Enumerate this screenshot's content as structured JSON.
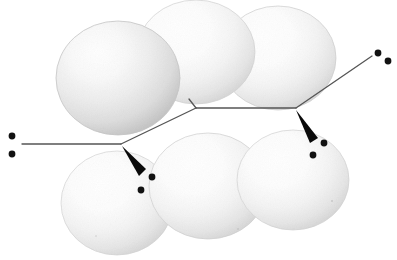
{
  "figure": {
    "background_color": "#ffffff",
    "width": 397,
    "height": 260
  },
  "palette": {
    "background": "#ffffff",
    "sphere_core": "#ffffff",
    "sphere_mid": "#f2f2f2",
    "sphere_edge": "#cfcfcf",
    "sphere_rim": "#bdbdbd",
    "bond_line": "#555555",
    "wedge_fill": "#0a0a0a",
    "dot_fill": "#121212"
  },
  "spheres": [
    {
      "id": "sphere-top-left",
      "label": "top-left sphere",
      "cx": 118,
      "cy": 78,
      "rx": 62,
      "ry": 57,
      "tone": "medium",
      "rim": "#c6c6c6"
    },
    {
      "id": "sphere-top-center",
      "label": "top-centre sphere",
      "cx": 196,
      "cy": 52,
      "rx": 59,
      "ry": 52,
      "tone": "light",
      "rim": "#d2d2d2"
    },
    {
      "id": "sphere-top-right",
      "label": "top-right sphere",
      "cx": 278,
      "cy": 58,
      "rx": 58,
      "ry": 52,
      "tone": "light",
      "rim": "#cfcfcf"
    },
    {
      "id": "sphere-bottom-left",
      "label": "bottom-left sphere",
      "cx": 117,
      "cy": 203,
      "rx": 56,
      "ry": 52,
      "tone": "light",
      "rim": "#d4d4d4"
    },
    {
      "id": "sphere-bottom-center",
      "label": "bottom-centre sphere",
      "cx": 208,
      "cy": 186,
      "rx": 59,
      "ry": 53,
      "tone": "light",
      "rim": "#d0d0d0"
    },
    {
      "id": "sphere-bottom-right",
      "label": "bottom-right sphere",
      "cx": 293,
      "cy": 180,
      "rx": 56,
      "ry": 50,
      "tone": "light",
      "rim": "#d2d2d2"
    }
  ],
  "bonds": {
    "stroke_color": "#555555",
    "stroke_width": 1.3,
    "segments": [
      {
        "id": "bond-left-terminal",
        "label": "left terminal bond",
        "x1": 22,
        "y1": 144,
        "x2": 121,
        "y2": 144
      },
      {
        "id": "bond-up-to-vertex",
        "label": "rising bond to first vertex",
        "x1": 121,
        "y1": 144,
        "x2": 196,
        "y2": 108
      },
      {
        "id": "bond-horizontal",
        "label": "central horizontal bond",
        "x1": 196,
        "y1": 108,
        "x2": 296,
        "y2": 108
      },
      {
        "id": "bond-right-rising",
        "label": "right rising bond",
        "x1": 296,
        "y1": 108,
        "x2": 372,
        "y2": 56
      },
      {
        "id": "bond-stub",
        "label": "short stub at first vertex",
        "x1": 196,
        "y1": 108,
        "x2": 189,
        "y2": 99
      }
    ]
  },
  "wedges": [
    {
      "id": "wedge-left",
      "label": "left solid wedge bond pointing down-right",
      "apex_x": 122,
      "apex_y": 146,
      "base_x1": 139,
      "base_y1": 176,
      "base_x2": 146,
      "base_y2": 169
    },
    {
      "id": "wedge-right",
      "label": "right solid wedge bond pointing down-left",
      "apex_x": 296,
      "apex_y": 110,
      "base_x1": 310,
      "base_y1": 143,
      "base_x2": 318,
      "base_y2": 138
    }
  ],
  "lone_pairs": [
    {
      "id": "lone-pair-left-outer",
      "label": "left terminal lone pair",
      "dots": [
        {
          "cx": 12,
          "cy": 136,
          "r": 3.4
        },
        {
          "cx": 12,
          "cy": 154,
          "r": 3.4
        }
      ]
    },
    {
      "id": "lone-pair-right-upper",
      "label": "upper right terminal lone pair",
      "dots": [
        {
          "cx": 378,
          "cy": 53,
          "r": 3.4
        },
        {
          "cx": 388,
          "cy": 61,
          "r": 3.4
        }
      ]
    },
    {
      "id": "lone-pair-bottom-left",
      "label": "lone pair at left wedge tip",
      "dots": [
        {
          "cx": 152,
          "cy": 177,
          "r": 3.4
        },
        {
          "cx": 141,
          "cy": 190,
          "r": 3.4
        }
      ]
    },
    {
      "id": "lone-pair-bottom-right",
      "label": "lone pair at right wedge tip",
      "dots": [
        {
          "cx": 324,
          "cy": 143,
          "r": 3.4
        },
        {
          "cx": 313,
          "cy": 155,
          "r": 3.4
        }
      ]
    }
  ],
  "speckles": [
    {
      "cx": 332,
      "cy": 201,
      "r": 1.1
    },
    {
      "cx": 238,
      "cy": 229,
      "r": 0.9
    },
    {
      "cx": 96,
      "cy": 236,
      "r": 0.8
    }
  ]
}
